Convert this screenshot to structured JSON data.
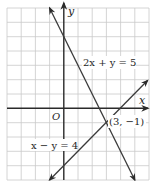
{
  "figure": {
    "type": "graph-of-linear-system",
    "grid": {
      "x_min": -4,
      "x_max": 6,
      "y_min": -5,
      "y_max": 7,
      "step": 1
    },
    "axes": {
      "x_label": "x",
      "y_label": "y",
      "origin_label": "O"
    },
    "lines": [
      {
        "equation": "2x + y = 5",
        "label": "2x + y = 5",
        "from": [
          -1,
          7
        ],
        "to": [
          5,
          -5
        ]
      },
      {
        "equation": "x − y = 4",
        "label": "x − y = 4",
        "from": [
          -1,
          -5
        ],
        "to": [
          6,
          2
        ]
      }
    ],
    "intersection": {
      "point": [
        3,
        -1
      ],
      "label": "(3, −1)"
    }
  },
  "colors": {
    "grid": "#c9c9c9",
    "axis": "#2a2a2a",
    "line": "#3a3a3a",
    "text": "#1e1e1e",
    "background": "#ffffff"
  }
}
